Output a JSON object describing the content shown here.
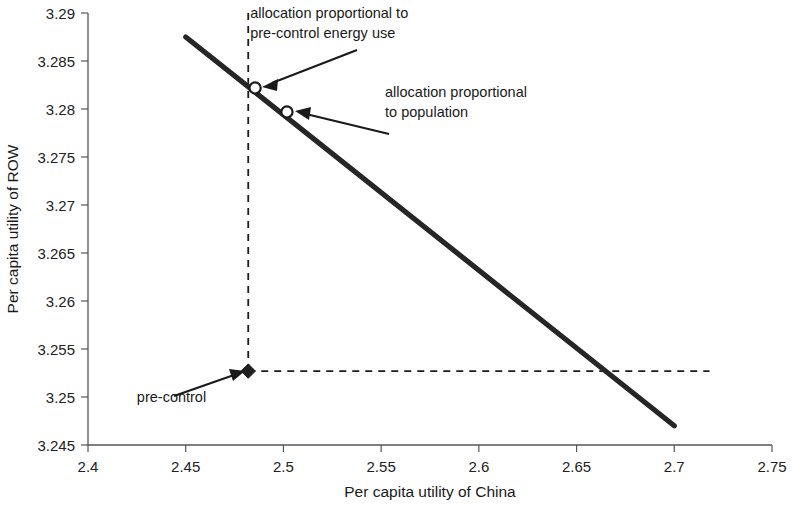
{
  "chart_data": {
    "type": "line",
    "title": "",
    "subtitle": "",
    "xlabel": "Per capita utility of China",
    "ylabel": "Per capita utility of ROW",
    "xlim": [
      2.4,
      2.75
    ],
    "ylim": [
      3.245,
      3.29
    ],
    "xticks": [
      "2.4",
      "2.45",
      "2.5",
      "2.55",
      "2.6",
      "2.65",
      "2.7",
      "2.75"
    ],
    "xtick_values": [
      2.4,
      2.45,
      2.5,
      2.55,
      2.6,
      2.65,
      2.7,
      2.75
    ],
    "yticks": [
      "3.245",
      "3.25",
      "3.255",
      "3.26",
      "3.265",
      "3.27",
      "3.275",
      "3.28",
      "3.285",
      "3.29"
    ],
    "ytick_values": [
      3.245,
      3.25,
      3.255,
      3.26,
      3.265,
      3.27,
      3.275,
      3.28,
      3.285,
      3.29
    ],
    "grid": false,
    "legend": "none",
    "series": [
      {
        "name": "utility possibility frontier",
        "type": "line",
        "style": "solid-thick",
        "x": [
          2.45,
          2.7
        ],
        "y": [
          3.2875,
          3.247
        ]
      },
      {
        "name": "pre-control vertical reference",
        "type": "line",
        "style": "dashed",
        "x": [
          2.482,
          2.482
        ],
        "y": [
          3.2527,
          3.29
        ]
      },
      {
        "name": "pre-control horizontal reference",
        "type": "line",
        "style": "dashed",
        "x": [
          2.482,
          2.718
        ],
        "y": [
          3.2527,
          3.2527
        ]
      }
    ],
    "points": [
      {
        "name": "allocation-proportional-to-pre-control-energy-use",
        "marker": "open-circle",
        "x": 2.4855,
        "y": 3.2822
      },
      {
        "name": "allocation-proportional-to-population",
        "marker": "open-circle",
        "x": 2.5018,
        "y": 3.2797
      },
      {
        "name": "pre-control",
        "marker": "filled-diamond",
        "x": 2.482,
        "y": 3.2527
      }
    ],
    "annotations": [
      {
        "name": "annotation-energy-use",
        "lines": [
          "allocation proportional to",
          "pre-control energy use"
        ],
        "text_x": 2.483,
        "text_y": 3.2895,
        "target_x": 2.4855,
        "target_y": 3.2822
      },
      {
        "name": "annotation-population",
        "lines": [
          "allocation proportional",
          "to population"
        ],
        "text_x": 2.552,
        "text_y": 3.2812,
        "target_x": 2.5018,
        "target_y": 3.2797
      },
      {
        "name": "annotation-pre-control",
        "lines": [
          "pre-control"
        ],
        "text_x": 2.425,
        "text_y": 3.2495,
        "target_x": 2.482,
        "target_y": 3.2527
      }
    ],
    "colors": {
      "line": "#262626",
      "dashed": "#1c1c1c",
      "axis": "#555555",
      "text": "#1a1a1a",
      "background": "#ffffff"
    }
  }
}
